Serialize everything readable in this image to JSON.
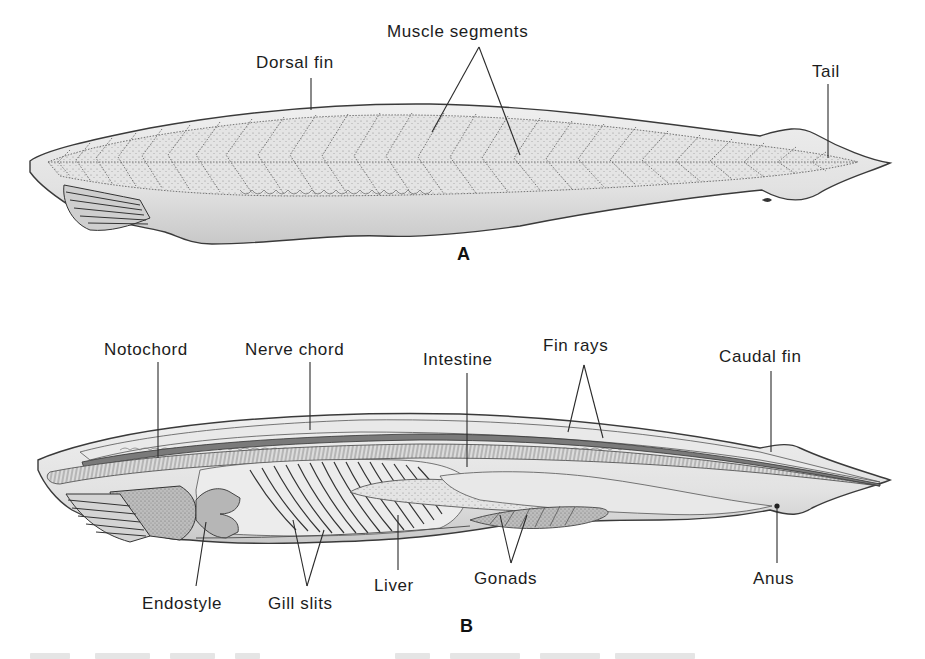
{
  "figure": {
    "panels": [
      {
        "id": "A",
        "letter": "A",
        "description": "External lateral view of lancelet (amphioxus)",
        "labels": {
          "dorsal_fin": "Dorsal fin",
          "muscle_segments": "Muscle segments",
          "tail": "Tail"
        }
      },
      {
        "id": "B",
        "letter": "B",
        "description": "Internal anatomy of lancelet (amphioxus)",
        "labels": {
          "notochord": "Notochord",
          "nerve_chord": "Nerve chord",
          "intestine": "Intestine",
          "fin_rays": "Fin rays",
          "caudal_fin": "Caudal fin",
          "endostyle": "Endostyle",
          "gill_slits": "Gill slits",
          "liver": "Liver",
          "gonads": "Gonads",
          "anus": "Anus"
        }
      }
    ],
    "caption_visible": false
  },
  "colors": {
    "body_fill": "#e6e6e6",
    "body_shade": "#c9c9c9",
    "outline": "#3a3a3a",
    "stipple": "#6a6a6a",
    "organ_dark": "#9a9a9a",
    "background": "#ffffff"
  }
}
